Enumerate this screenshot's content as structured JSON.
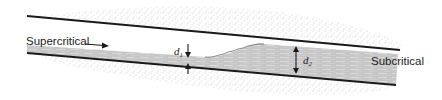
{
  "figure": {
    "labels": {
      "upstream_flow": "Supercritical",
      "downstream_flow": "Subcritical",
      "depth_before": "d",
      "depth_before_sub": "1",
      "depth_after": "d",
      "depth_after_sub": "2"
    },
    "colors": {
      "wall": "#1a1a1a",
      "water": "#c9c9c9",
      "water_streak": "#e6e6e6",
      "ground_stipple": "#9a9a9a",
      "background": "#ffffff"
    }
  }
}
